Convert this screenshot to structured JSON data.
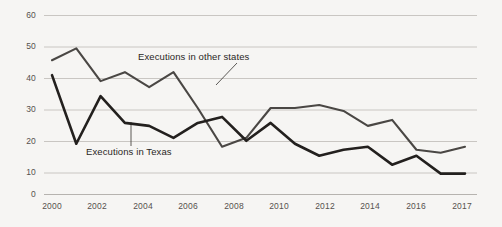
{
  "chart_data": {
    "type": "line",
    "title": "",
    "subtitle": "",
    "xlabel": "",
    "ylabel": "",
    "x": [
      2000,
      2001,
      2002,
      2003,
      2004,
      2005,
      2006,
      2007,
      2008,
      2009,
      2010,
      2011,
      2012,
      2013,
      2014,
      2015,
      2016,
      2017
    ],
    "xlim": [
      2000,
      2017
    ],
    "ylim": [
      0,
      60
    ],
    "yticks": [
      0,
      10,
      20,
      30,
      40,
      50,
      60
    ],
    "ytick_labels": [
      "0",
      "10",
      "20",
      "30",
      "40",
      "50",
      "60"
    ],
    "xticks": [
      2000,
      2002,
      2004,
      2006,
      2008,
      2010,
      2012,
      2014,
      2016,
      2017
    ],
    "xtick_labels": [
      "2000",
      "2002",
      "2004",
      "2006",
      "2008",
      "2010",
      "2012",
      "2014",
      "2016",
      "2017"
    ],
    "grid": true,
    "grid_axis": "y",
    "legend": "inline-annotations",
    "series": [
      {
        "name": "Executions in other states",
        "color": "#4a4744",
        "width": 2.1,
        "values": [
          45,
          49,
          38,
          41,
          36,
          41,
          29,
          16,
          19,
          29,
          29,
          30,
          28,
          23,
          25,
          15,
          14,
          16
        ]
      },
      {
        "name": "Executions in Texas",
        "color": "#23201e",
        "width": 2.6,
        "values": [
          40,
          17,
          33,
          24,
          23,
          19,
          24,
          26,
          18,
          24,
          17,
          13,
          15,
          16,
          10,
          13,
          7,
          7
        ]
      }
    ],
    "annotations": [
      {
        "text": "Executions in other states",
        "target_x": 2006,
        "target_y": 36
      },
      {
        "text": "Executions in Texas",
        "target_x": 2003,
        "target_y": 24
      }
    ],
    "colors": {
      "background": "#f6f5f3",
      "gridline": "#c9c6c2",
      "axis_text": "#55514e"
    }
  }
}
